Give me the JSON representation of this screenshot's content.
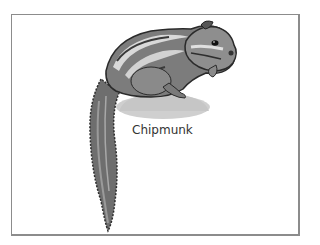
{
  "card": {
    "label": "Chipmunk",
    "border_color": "#8c8c8c"
  },
  "image": {
    "subject": "chipmunk-illustration",
    "palette": {
      "fur_dark": "#3a3a3a",
      "fur_mid": "#7a7a7a",
      "fur_light": "#b5b5b5",
      "stripe": "#d9d9d9",
      "rock": "#cfcfcf"
    }
  }
}
